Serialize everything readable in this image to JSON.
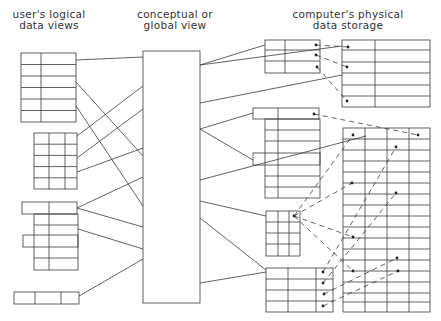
{
  "headings": {
    "left": [
      "user's logical",
      "data views"
    ],
    "center": [
      "conceptual or",
      "global view"
    ],
    "right": [
      "computer's physical",
      "data storage"
    ]
  },
  "colors": {
    "line": "#3a3a3a",
    "background": "#ffffff"
  },
  "diagram": {
    "nodes": [
      {
        "id": "logical-view-1",
        "group": "user's logical data views",
        "shape": "table 2 cols x 6 rows"
      },
      {
        "id": "logical-view-2",
        "group": "user's logical data views",
        "shape": "table 3 cols x 5 rows"
      },
      {
        "id": "logical-view-3",
        "group": "user's logical data views",
        "shape": "table 2 cols x 6 rows, staggered"
      },
      {
        "id": "logical-view-4",
        "group": "user's logical data views",
        "shape": "table 3 cols x 1 row"
      },
      {
        "id": "global-view",
        "group": "conceptual or global view",
        "shape": "tall rectangle"
      },
      {
        "id": "mapping-table-1",
        "group": "computer's physical data storage",
        "shape": "table 2 cols x 3 rows with pointers"
      },
      {
        "id": "mapping-table-2",
        "group": "computer's physical data storage",
        "shape": "table 2 cols x 8 rows, staggered, with pointer"
      },
      {
        "id": "mapping-table-3",
        "group": "computer's physical data storage",
        "shape": "table 3 cols x 4 rows with pointer"
      },
      {
        "id": "mapping-table-4",
        "group": "computer's physical data storage",
        "shape": "table 3 cols x 4 rows with pointers"
      },
      {
        "id": "storage-block-1",
        "group": "computer's physical data storage",
        "shape": "table 2 cols x 6 rows"
      },
      {
        "id": "storage-block-2",
        "group": "computer's physical data storage",
        "shape": "table 4 cols x 17 rows"
      }
    ],
    "edges": {
      "solid": "logical views ↔ global view ↔ storage tables",
      "dashed": "pointers from mapping tables to storage records"
    }
  }
}
